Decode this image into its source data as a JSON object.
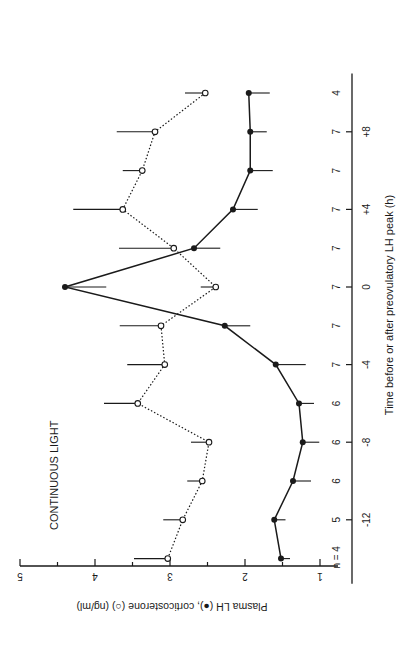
{
  "chart_data": {
    "type": "line",
    "title": "CONTINUOUS LIGHT",
    "xlabel": "Time before or after preovulatory LH peak (h)",
    "ylabel": "Plasma LH (●), corticosterone (○) (ng/ml)",
    "x_ticks": [
      -12,
      -8,
      -4,
      0,
      4,
      8
    ],
    "x_tick_labels": [
      "-12",
      "-8",
      "-4",
      "0",
      "+4",
      "+8"
    ],
    "y_ticks": [
      1,
      2,
      3,
      4,
      5
    ],
    "y_tick_labels": [
      "1",
      "2",
      "3",
      "4",
      "5"
    ],
    "ylim": [
      1,
      5
    ],
    "xlim": [
      -15,
      11
    ],
    "orientation": "rotated 90 degrees clockwise",
    "n_label": "n =",
    "x": [
      -14,
      -12,
      -10,
      -8,
      -6,
      -4,
      -2,
      0,
      2,
      4,
      6,
      8,
      10
    ],
    "n": [
      4,
      5,
      6,
      6,
      6,
      7,
      7,
      7,
      7,
      7,
      7,
      7,
      4
    ],
    "series": [
      {
        "name": "Plasma LH",
        "marker": "filled-circle",
        "line": "solid",
        "values": [
          1.52,
          1.61,
          1.36,
          1.23,
          1.28,
          1.59,
          2.27,
          4.4,
          2.68,
          2.16,
          1.93,
          1.93,
          1.95
        ],
        "error": [
          0.12,
          0.15,
          0.24,
          0.22,
          0.2,
          0.4,
          0.34,
          0.55,
          0.35,
          0.33,
          0.3,
          0.22,
          0.28
        ],
        "error_direction": "down"
      },
      {
        "name": "Corticosterone",
        "marker": "open-circle",
        "line": "dotted",
        "values": [
          3.03,
          2.83,
          2.57,
          2.48,
          3.43,
          3.07,
          3.12,
          2.39,
          2.95,
          3.63,
          3.37,
          3.2,
          2.53
        ],
        "error": [
          0.45,
          0.26,
          0.2,
          0.24,
          0.45,
          0.5,
          0.55,
          0.2,
          0.73,
          0.66,
          0.26,
          0.51,
          0.27
        ],
        "error_direction": "up"
      }
    ]
  },
  "labels": {
    "title": "CONTINUOUS LIGHT",
    "xlabel": "Time before or after preovulatory LH peak (h)",
    "ylabel": "Plasma LH (●), corticosterone (○) (ng/ml)"
  }
}
